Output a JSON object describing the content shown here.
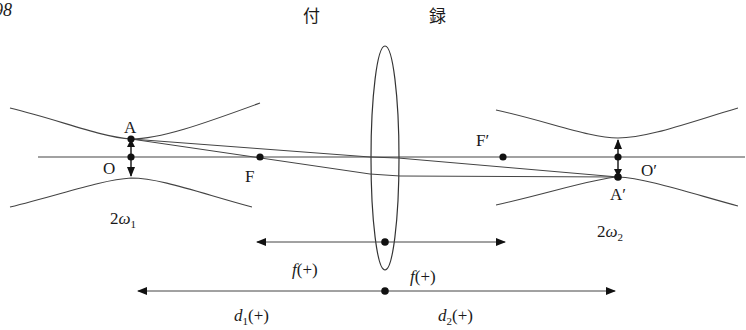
{
  "header": {
    "page_number": "98",
    "title_char_1": "付",
    "title_char_2": "録"
  },
  "diagram": {
    "points": {
      "A": "A",
      "O": "O",
      "F": "F",
      "F_prime": "F′",
      "A_prime": "A′",
      "O_prime": "O′"
    },
    "waist_labels": {
      "left_prefix": "2",
      "left_symbol": "ω",
      "left_sub": "1",
      "right_prefix": "2",
      "right_symbol": "ω",
      "right_sub": "2"
    },
    "dimension_labels": {
      "f_left": "f",
      "f_left_sign": "(+)",
      "f_right": "f",
      "f_right_sign": "(+)",
      "d1": "d",
      "d1_sub": "1",
      "d1_sign": "(+)",
      "d2": "d",
      "d2_sub": "2",
      "d2_sign": "(+)"
    },
    "colors": {
      "line": "#3a3a3a",
      "dot": "#111111"
    }
  }
}
